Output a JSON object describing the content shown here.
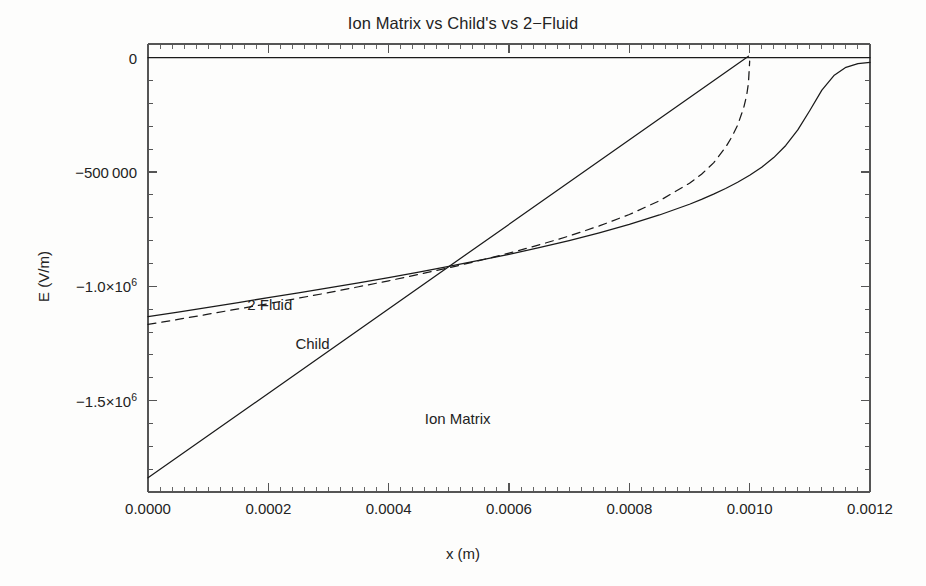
{
  "chart_data": {
    "type": "line",
    "title": "Ion Matrix vs Child's vs 2−Fluid",
    "xlabel": "x (m)",
    "ylabel": "E (V/m)",
    "xlim": [
      0.0,
      0.0012
    ],
    "ylim": [
      -1900000,
      60000
    ],
    "grid": false,
    "legend_position": "inline-annotations",
    "xticks": [
      {
        "value": 0.0,
        "label": "0.0000"
      },
      {
        "value": 0.0002,
        "label": "0.0002"
      },
      {
        "value": 0.0004,
        "label": "0.0004"
      },
      {
        "value": 0.0006,
        "label": "0.0006"
      },
      {
        "value": 0.0008,
        "label": "0.0008"
      },
      {
        "value": 0.001,
        "label": "0.0010"
      },
      {
        "value": 0.0012,
        "label": "0.0012"
      }
    ],
    "yticks": [
      {
        "value": 0,
        "label": "0",
        "exponent": ""
      },
      {
        "value": -500000,
        "label": "−500 000",
        "exponent": ""
      },
      {
        "value": -1000000,
        "label": "−1.0×10",
        "exponent": "6"
      },
      {
        "value": -1500000,
        "label": "−1.5×10",
        "exponent": "6"
      }
    ],
    "annotations": [
      {
        "text": "2 Fluid",
        "x": 0.000165,
        "y": -1085000
      },
      {
        "text": "Child",
        "x": 0.000245,
        "y": -1255000
      },
      {
        "text": "Ion Matrix",
        "x": 0.00046,
        "y": -1585000
      }
    ],
    "series": [
      {
        "name": "2 Fluid",
        "style": "solid",
        "color": "#1a1a1a",
        "x": [
          0.0,
          5e-05,
          0.0001,
          0.00015,
          0.0002,
          0.00025,
          0.0003,
          0.00035,
          0.0004,
          0.00045,
          0.0005,
          0.00055,
          0.0006,
          0.00065,
          0.0007,
          0.00075,
          0.0008,
          0.00085,
          0.0009,
          0.00092,
          0.00094,
          0.00096,
          0.00098,
          0.001,
          0.00102,
          0.00104,
          0.00106,
          0.00108,
          0.0011,
          0.00112,
          0.00114,
          0.00116,
          0.00118,
          0.0012
        ],
        "y": [
          -1133000,
          -1113000,
          -1092000,
          -1071000,
          -1050000,
          -1029000,
          -1007000,
          -985000,
          -962000,
          -938000,
          -913000,
          -887000,
          -860000,
          -831000,
          -800000,
          -766000,
          -729000,
          -688000,
          -641000,
          -620000,
          -597000,
          -572000,
          -545000,
          -514000,
          -479000,
          -437000,
          -384000,
          -316000,
          -231000,
          -142000,
          -78000,
          -42000,
          -26000,
          -20000
        ]
      },
      {
        "name": "Child",
        "style": "dashed",
        "color": "#1a1a1a",
        "x": [
          0.0,
          5e-05,
          0.0001,
          0.00015,
          0.0002,
          0.00025,
          0.0003,
          0.00035,
          0.0004,
          0.00045,
          0.0005,
          0.00055,
          0.0006,
          0.00065,
          0.0007,
          0.00075,
          0.0008,
          0.00085,
          0.0009,
          0.00092,
          0.00094,
          0.00096,
          0.00097,
          0.00098,
          0.00099,
          0.000995,
          0.000998,
          0.001
        ],
        "y": [
          -1167000,
          -1145000,
          -1122000,
          -1099000,
          -1076000,
          -1052000,
          -1028000,
          -1002000,
          -976000,
          -948000,
          -919000,
          -888000,
          -855000,
          -819000,
          -780000,
          -736000,
          -686000,
          -626000,
          -549000,
          -510000,
          -460000,
          -392000,
          -348000,
          -295000,
          -220000,
          -165000,
          -110000,
          -15000
        ]
      },
      {
        "name": "Ion Matrix",
        "style": "solid",
        "color": "#1a1a1a",
        "x": [
          0.0,
          0.0012
        ],
        "y": [
          -1838000,
          380000
        ],
        "clip_at_zero_x": 0.000998
      },
      {
        "name": "zero-axis-line",
        "style": "solid",
        "color": "#1a1a1a",
        "x": [
          0.0,
          0.0012
        ],
        "y": [
          0,
          0
        ]
      }
    ]
  },
  "figure": {
    "frame_color": "#555555",
    "background": "#fdfdfc"
  }
}
